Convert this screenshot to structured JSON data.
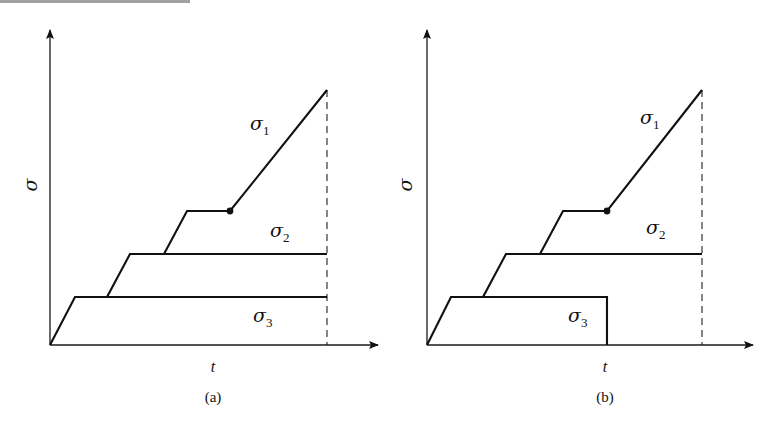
{
  "figure": {
    "top_cutoff_text": "... ... ... ...",
    "panels": [
      {
        "id": "a",
        "caption": "(a)",
        "y_axis_label": "σ",
        "x_axis_label": "t",
        "curves": [
          {
            "name": "σ",
            "subscript": "1",
            "description": "ramp, hold, then ramp continues to failure"
          },
          {
            "name": "σ",
            "subscript": "2",
            "description": "ramp then hold to end"
          },
          {
            "name": "σ",
            "subscript": "3",
            "description": "ramp then hold to end"
          }
        ],
        "notes": "All three stresses held until the end time (dashed line); σ1 loading resumes after hold point (dot)."
      },
      {
        "id": "b",
        "caption": "(b)",
        "y_axis_label": "σ",
        "x_axis_label": "t",
        "curves": [
          {
            "name": "σ",
            "subscript": "1",
            "description": "ramp, hold, then ramp continues to failure"
          },
          {
            "name": "σ",
            "subscript": "2",
            "description": "ramp then hold to end"
          },
          {
            "name": "σ",
            "subscript": "3",
            "description": "ramp, hold, then unloaded to zero at the point σ1 resumes"
          }
        ],
        "notes": "σ3 is released (drops to zero) at the moment σ1 resumes loading."
      }
    ]
  }
}
